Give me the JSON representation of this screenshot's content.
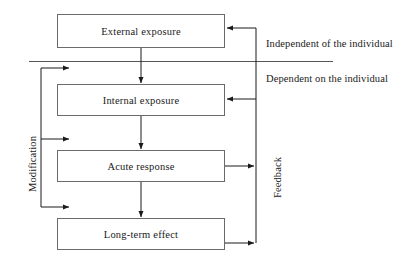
{
  "diagram": {
    "nodes": [
      {
        "id": "external-exposure",
        "label": "External exposure"
      },
      {
        "id": "internal-exposure",
        "label": "Internal exposure"
      },
      {
        "id": "acute-response",
        "label": "Acute response"
      },
      {
        "id": "long-term-effect",
        "label": "Long-term effect"
      }
    ],
    "section_notes": [
      {
        "id": "independent",
        "label": "Independent of the individual"
      },
      {
        "id": "dependent",
        "label": "Dependent on the individual"
      }
    ],
    "axis_labels": [
      {
        "id": "modification",
        "label": "Modification",
        "orientation": "vertical-left"
      },
      {
        "id": "feedback",
        "label": "Feedback",
        "orientation": "vertical-right"
      }
    ],
    "colors": {
      "box_border": "#6a6a6a",
      "connector": "#1a1a1a",
      "divider": "#555555",
      "text": "#1a1a1a",
      "background": "#ffffff"
    }
  }
}
